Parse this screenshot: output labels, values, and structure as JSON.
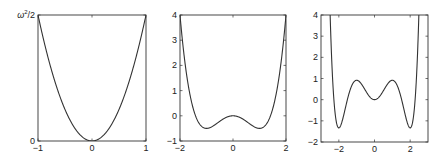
{
  "chart_data": [
    {
      "type": "line",
      "title": "",
      "xlabel": "",
      "ylabel": "",
      "box": {
        "left": 38,
        "top": 15,
        "right": 146,
        "bottom": 141
      },
      "xlim": [
        -1,
        1
      ],
      "ylim": [
        0,
        1
      ],
      "xticks": [
        {
          "v": -1,
          "label": "−1"
        },
        {
          "v": 0,
          "label": "0"
        },
        {
          "v": 1,
          "label": "1"
        }
      ],
      "yticks": [
        {
          "v": 0,
          "label": "0"
        },
        {
          "v": 1,
          "label": "ω²/2",
          "math": true
        }
      ],
      "series": [
        {
          "name": "harmonic potential ω²x²/2",
          "fn": "harmonic"
        }
      ],
      "description": "Parabola V = ω² x² / 2, minimum 0 at x = 0, reaching ω²/2 at x = ±1"
    },
    {
      "type": "line",
      "title": "",
      "xlabel": "",
      "ylabel": "",
      "box": {
        "left": 180,
        "top": 15,
        "right": 286,
        "bottom": 141
      },
      "xlim": [
        -2,
        2
      ],
      "ylim": [
        -1,
        4
      ],
      "xticks": [
        {
          "v": -2,
          "label": "−2"
        },
        {
          "v": 0,
          "label": "0"
        },
        {
          "v": 2,
          "label": "2"
        }
      ],
      "yticks": [
        {
          "v": -1,
          "label": "−1"
        },
        {
          "v": 0,
          "label": "0"
        },
        {
          "v": 1,
          "label": "1"
        },
        {
          "v": 2,
          "label": "2"
        },
        {
          "v": 3,
          "label": "3"
        },
        {
          "v": 4,
          "label": "4"
        }
      ],
      "series": [
        {
          "name": "double-well potential",
          "fn": "doublewell"
        }
      ],
      "description": "Double well V = x^4/2 − x^2: local max 0 at x=0, minima −0.5 at x=±1, value 4 at x=±2"
    },
    {
      "type": "line",
      "title": "",
      "xlabel": "",
      "ylabel": "",
      "box": {
        "left": 321,
        "top": 15,
        "right": 428,
        "bottom": 142
      },
      "xlim": [
        -3,
        3
      ],
      "ylim": [
        -2,
        4
      ],
      "xticks": [
        {
          "v": -2,
          "label": "−2"
        },
        {
          "v": 0,
          "label": "0"
        },
        {
          "v": 2,
          "label": "2"
        }
      ],
      "yticks": [
        {
          "v": -2,
          "label": "−2"
        },
        {
          "v": -1,
          "label": "−1"
        },
        {
          "v": 0,
          "label": "0"
        },
        {
          "v": 1,
          "label": "1"
        },
        {
          "v": 2,
          "label": "2"
        },
        {
          "v": 3,
          "label": "3"
        },
        {
          "v": 4,
          "label": "4"
        }
      ],
      "series": [
        {
          "name": "triple-well potential",
          "fn": "triplewell"
        }
      ],
      "description": "Triple well V = x^6/6 − 1.25x^4 + 2x^2: local min 0 at x=0, maxima ≈0.92 at x=±1, minima ≈−1.33 at x=±2, rising above 4 near x=±2.5"
    }
  ]
}
